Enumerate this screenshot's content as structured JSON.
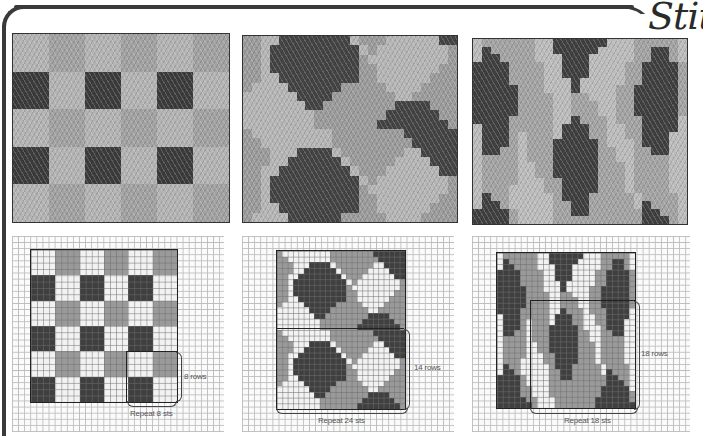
{
  "page": {
    "title": "Stitc",
    "colors": {
      "light": "#f2f2f2",
      "mid": "#9a9a9a",
      "dark": "#3f3f3f",
      "frame": "#3a3a3a"
    }
  },
  "swatches": [
    {
      "name": "checkerboard-swatch",
      "description": "Knitted swatch: grey blocks with dark squares"
    },
    {
      "name": "diamond-swatch",
      "description": "Knitted swatch: dark and light hexagonal diamonds"
    },
    {
      "name": "flame-swatch",
      "description": "Knitted swatch: elongated dark diamonds in vertical columns"
    }
  ],
  "charts": [
    {
      "rows_label": "8 rows",
      "sts_label": "Repeat 8 sts",
      "cols": 24,
      "rows": 24,
      "pattern": [
        "000011110000111100001111",
        "000011110000111100001111",
        "000011110000111100001111",
        "000011110000111100001111",
        "222200002222000022220000",
        "222200002222000022220000",
        "222200002222000022220000",
        "222200002222000022220000",
        "000011110000111100001111",
        "000011110000111100001111",
        "000011110000111100001111",
        "000011110000111100001111",
        "222200002222000022220000",
        "222200002222000022220000",
        "222200002222000022220000",
        "222200002222000022220000",
        "000011110000111100001111",
        "000011110000111100001111",
        "000011110000111100001111",
        "000011110000111100001111",
        "222200002222000022220000",
        "222200002222000022220000",
        "222200002222000022220000",
        "222200002222000022220000"
      ]
    },
    {
      "rows_label": "14 rows",
      "sts_label": "Repeat 24 sts",
      "cols": 24,
      "rows": 28,
      "pattern": [
        "100000000011111111222222",
        "110000000011111111122222",
        "111000222201111111002222",
        "111002222220111110000222",
        "110022222222011100000022",
        "110222222222201000000001",
        "110222222222210000000001",
        "110222222222211000000011",
        "110022222222211000000111",
        "100002222221111100001111",
        "000000222211111110011111",
        "000000022111111112222111",
        "000000001111111122222211",
        "000000001111111222222221",
        "100000000011111111222222",
        "110000000011111111122222",
        "111000222201111111002222",
        "111002222220111110000222",
        "110022222222011100000022",
        "110222222222201000000001",
        "110222222222210000000001",
        "110222222222211000000011",
        "110022222222211000000111",
        "100002222221111100001111",
        "000000222211111110011111",
        "000000022111111112222111",
        "000000001111111122222211",
        "000000001111111222222221"
      ]
    },
    {
      "rows_label": "18 rows",
      "sts_label": "Repeat 18 sts",
      "cols": 24,
      "rows": 28,
      "pattern": [
        "011111100222222000111110",
        "021111100222220000112210",
        "022111100022200000112210",
        "222211110022200001122221",
        "222211110022200001122221",
        "222211110002000001122221",
        "222221110002000011222221",
        "222221111001100011222221",
        "222221111001110011222221",
        "222221111001110011222221",
        "222211111002111011122220",
        "022211111022211001122220",
        "022210111022211001122200",
        "022210111222221000122200",
        "022110111222221100112200",
        "011110111222221100111100",
        "011110011222221110111100",
        "011110011222221110111100",
        "011110001122221110111100",
        "011100001122221110111100",
        "021100000122211111011110",
        "022100000112211111021110",
        "222210000112211111122110",
        "222210000111111111122210",
        "222211000111111111222220",
        "222211000111111111222221",
        "222221100011111112222221",
        "222222100011111112222222"
      ]
    }
  ]
}
